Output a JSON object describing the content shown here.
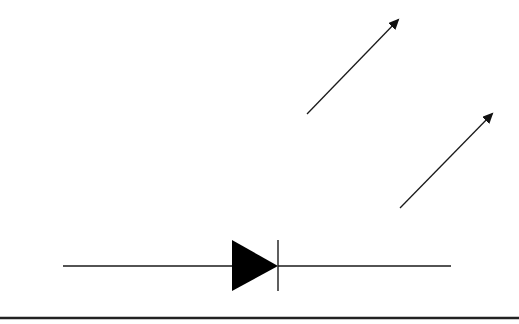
{
  "diagram": {
    "title": "",
    "type": "schematic-symbol",
    "symbol": "light-emitting-diode",
    "colors": {
      "stroke": "#1a1a1a",
      "fill": "#000000",
      "background": "#ffffff"
    },
    "components": [
      {
        "id": "lead-left",
        "kind": "wire",
        "x1": 63,
        "y1": 266,
        "x2": 232,
        "y2": 266
      },
      {
        "id": "anode-triangle",
        "kind": "triangle",
        "points": "232,240 232,291 278,266"
      },
      {
        "id": "cathode-bar",
        "kind": "bar",
        "x1": 278,
        "y1": 240,
        "x2": 278,
        "y2": 291
      },
      {
        "id": "lead-right",
        "kind": "wire",
        "x1": 278,
        "y1": 266,
        "x2": 451,
        "y2": 266
      },
      {
        "id": "emission-arrow-1",
        "kind": "arrow",
        "x1": 307,
        "y1": 114,
        "x2": 398,
        "y2": 20
      },
      {
        "id": "emission-arrow-2",
        "kind": "arrow",
        "x1": 400,
        "y1": 208,
        "x2": 492,
        "y2": 114
      }
    ],
    "bottom_rule": {
      "y": 318,
      "x1": 0,
      "x2": 519
    }
  }
}
